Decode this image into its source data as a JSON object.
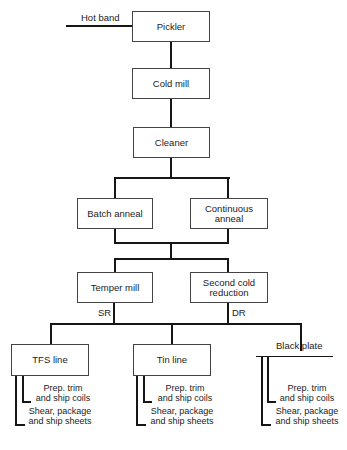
{
  "diagram": {
    "type": "flowchart",
    "input": {
      "label": "Hot band"
    },
    "steps": {
      "pickler": "Pickler",
      "cold_mill": "Cold mill",
      "cleaner": "Cleaner",
      "batch_anneal": "Batch anneal",
      "continuous_anneal_1": "Continuous",
      "continuous_anneal_2": "anneal",
      "temper_mill": "Temper mill",
      "second_cold_reduction_1": "Second cold",
      "second_cold_reduction_2": "reduction"
    },
    "branch_labels": {
      "sr": "SR",
      "dr": "DR"
    },
    "products": [
      {
        "label": "TFS line"
      },
      {
        "label": "Tin line"
      },
      {
        "label": "Black plate"
      }
    ],
    "finishing": {
      "coils_1": "Prep. trim",
      "coils_2": "and ship coils",
      "sheets_1": "Shear, package",
      "sheets_2": "and ship sheets"
    },
    "edges": [
      [
        "Hot band",
        "Pickler"
      ],
      [
        "Pickler",
        "Cold mill"
      ],
      [
        "Cold mill",
        "Cleaner"
      ],
      [
        "Cleaner",
        "Batch anneal"
      ],
      [
        "Cleaner",
        "Continuous anneal"
      ],
      [
        "Batch anneal",
        "Temper mill"
      ],
      [
        "Continuous anneal",
        "Temper mill"
      ],
      [
        "Batch anneal",
        "Second cold reduction"
      ],
      [
        "Continuous anneal",
        "Second cold reduction"
      ],
      [
        "Temper mill (SR)",
        "TFS line"
      ],
      [
        "Temper mill (SR)",
        "Tin line"
      ],
      [
        "Temper mill (SR)",
        "Black plate"
      ],
      [
        "Second cold reduction (DR)",
        "TFS line"
      ],
      [
        "Second cold reduction (DR)",
        "Tin line"
      ],
      [
        "Second cold reduction (DR)",
        "Black plate"
      ],
      [
        "TFS line",
        "Prep. trim and ship coils"
      ],
      [
        "TFS line",
        "Shear, package and ship sheets"
      ],
      [
        "Tin line",
        "Prep. trim and ship coils"
      ],
      [
        "Tin line",
        "Shear, package and ship sheets"
      ],
      [
        "Black plate",
        "Prep. trim and ship coils"
      ],
      [
        "Black plate",
        "Shear, package and ship sheets"
      ]
    ]
  }
}
